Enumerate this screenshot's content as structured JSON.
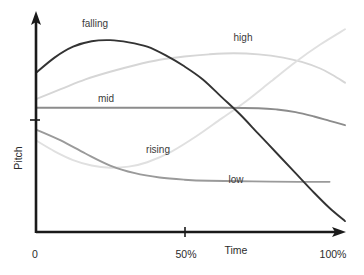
{
  "chart_data": {
    "type": "line",
    "title": "",
    "subtitle": "",
    "xlabel": "Time",
    "ylabel": "Pitch",
    "xlim": [
      0,
      100
    ],
    "ylim": [
      0,
      100
    ],
    "grid": false,
    "legend_position": "inline-annotations",
    "x_tick_labels": [
      "0",
      "50%",
      "100%"
    ],
    "x_tick_values": [
      0,
      50,
      100
    ],
    "y_tick_labels": [
      ""
    ],
    "y_tick_values": [
      38
    ],
    "annotations": [
      {
        "text": "falling",
        "x": 21,
        "y": 89
      },
      {
        "text": "high",
        "x": 63,
        "y": 84
      },
      {
        "text": "mid",
        "x": 25,
        "y": 58
      },
      {
        "text": "rising",
        "x": 42,
        "y": 32
      },
      {
        "text": "low",
        "x": 66,
        "y": 17
      }
    ],
    "series": [
      {
        "name": "falling",
        "color": "#333333",
        "width": 1.9,
        "label": "falling",
        "x": [
          0,
          6,
          12,
          18,
          24,
          30,
          36,
          42,
          48,
          54,
          60,
          66,
          72,
          78,
          84,
          90,
          95,
          100
        ],
        "y": [
          73,
          80,
          85,
          87.5,
          88,
          87,
          85,
          81,
          76,
          70,
          62,
          54,
          45,
          36,
          27,
          18,
          11,
          5
        ]
      },
      {
        "name": "high",
        "color": "#d6d6d6",
        "width": 1.9,
        "label": "high",
        "x": [
          0,
          8,
          16,
          24,
          32,
          40,
          48,
          56,
          64,
          72,
          80,
          86,
          92,
          96,
          100
        ],
        "y": [
          61,
          65.5,
          70,
          73.5,
          76.5,
          79,
          80.5,
          81.5,
          82,
          81.5,
          80,
          78,
          75,
          72,
          68.5
        ]
      },
      {
        "name": "mid",
        "color": "#8c8c8c",
        "width": 1.9,
        "label": "mid",
        "x": [
          0,
          20,
          40,
          60,
          72,
          78,
          84,
          90,
          95,
          100
        ],
        "y": [
          57,
          57,
          57,
          57,
          56.8,
          56.2,
          55,
          53,
          51,
          49
        ]
      },
      {
        "name": "rising",
        "color": "#e0e0e0",
        "width": 1.9,
        "label": "rising",
        "x": [
          0,
          6,
          12,
          18,
          24,
          30,
          36,
          44,
          52,
          60,
          68,
          76,
          84,
          92,
          100
        ],
        "y": [
          42,
          37,
          33,
          30.5,
          29.5,
          30,
          32,
          37,
          44,
          52,
          60,
          69,
          78,
          86,
          93
        ]
      },
      {
        "name": "low",
        "color": "#9a9a9a",
        "width": 1.9,
        "label": "low",
        "x": [
          0,
          8,
          16,
          24,
          32,
          40,
          48,
          56,
          70,
          85,
          95
        ],
        "y": [
          47,
          42,
          36,
          30.5,
          27,
          25,
          24,
          23.5,
          23.2,
          23,
          23
        ]
      }
    ]
  },
  "axes": {
    "x_axis_name": "time-axis",
    "y_axis_name": "pitch-axis",
    "x_label": "Time",
    "y_label": "Pitch",
    "x_tick_0": "0",
    "x_tick_50": "50%",
    "x_tick_100": "100%"
  }
}
